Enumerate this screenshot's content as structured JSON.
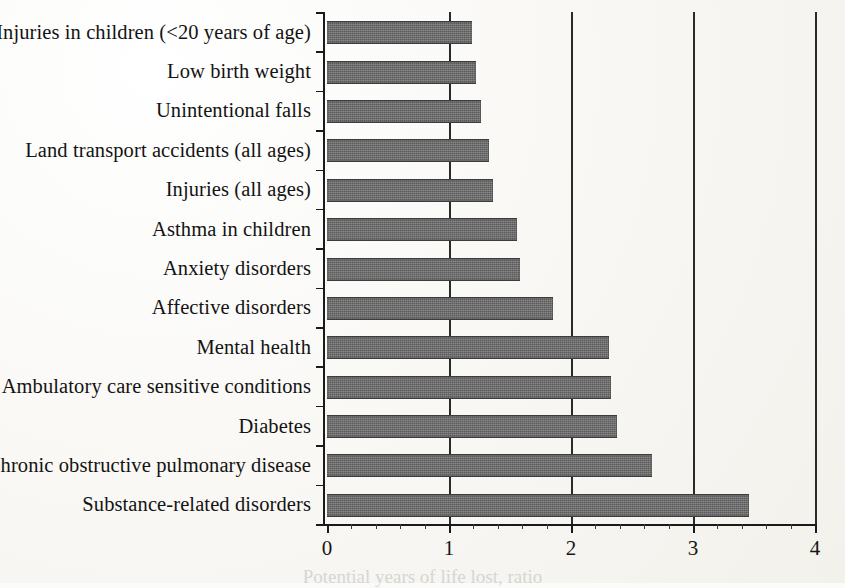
{
  "chart_data": {
    "type": "bar",
    "orientation": "horizontal",
    "title": "",
    "xlabel": "Potential years of life lost, ratio",
    "ylabel": "",
    "xlim": [
      0,
      4
    ],
    "xticks": [
      0,
      1,
      2,
      3,
      4
    ],
    "xtick_labels": [
      "0",
      "1",
      "2",
      "3",
      "4"
    ],
    "minor_tick_step": 0.2,
    "grid": true,
    "gridlines_at": [
      1,
      2,
      3,
      4
    ],
    "legend": "none",
    "bar_color": "#5a5a5a",
    "categories": [
      "Injuries in children (<20 years of age)",
      "Low birth weight",
      "Unintentional falls",
      "Land transport accidents (all ages)",
      "Injuries (all ages)",
      "Asthma in children",
      "Anxiety disorders",
      "Affective disorders",
      "Mental health",
      "Ambulatory care sensitive conditions",
      "Diabetes",
      "Chronic obstructive pulmonary disease",
      "Substance-related disorders"
    ],
    "values": [
      1.19,
      1.22,
      1.26,
      1.33,
      1.36,
      1.56,
      1.58,
      1.85,
      2.31,
      2.33,
      2.38,
      2.66,
      3.46
    ]
  }
}
